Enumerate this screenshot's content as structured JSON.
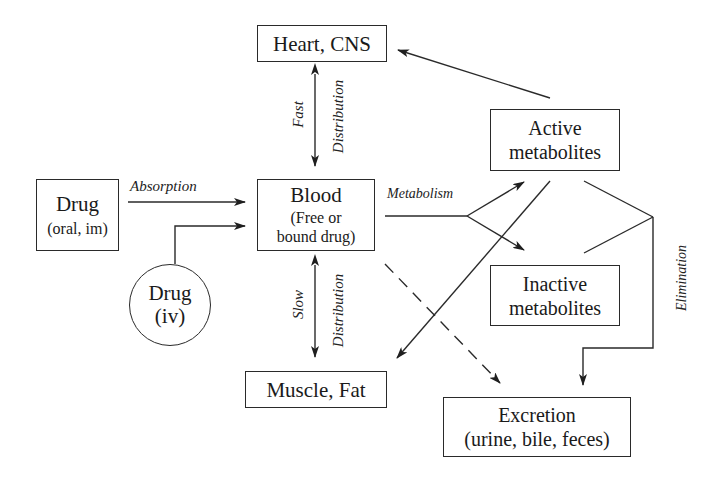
{
  "diagram": {
    "nodes": {
      "heart": {
        "label": "Heart, CNS"
      },
      "drug_oral": {
        "title": "Drug",
        "subtitle": "(oral, im)"
      },
      "blood": {
        "title": "Blood",
        "line2": "(Free or",
        "line3": "bound drug)"
      },
      "drug_iv": {
        "title": "Drug",
        "subtitle": "(iv)"
      },
      "muscle": {
        "label": "Muscle, Fat"
      },
      "active": {
        "line1": "Active",
        "line2": "metabolites"
      },
      "inactive": {
        "line1": "Inactive",
        "line2": "metabolites"
      },
      "excretion": {
        "line1": "Excretion",
        "line2": "(urine, bile, feces)"
      }
    },
    "edge_labels": {
      "absorption": "Absorption",
      "metabolism": "Metabolism",
      "fast": "Fast",
      "fast_distribution": "Distribution",
      "slow": "Slow",
      "slow_distribution": "Distribution",
      "elimination": "Elimination"
    },
    "edges": [
      {
        "from": "drug_oral",
        "to": "blood",
        "label": "Absorption"
      },
      {
        "from": "drug_iv",
        "to": "blood"
      },
      {
        "from": "blood",
        "to": "heart",
        "bidirectional": true,
        "label": "Fast Distribution"
      },
      {
        "from": "blood",
        "to": "muscle",
        "bidirectional": true,
        "label": "Slow Distribution"
      },
      {
        "from": "blood",
        "to": "active",
        "label": "Metabolism"
      },
      {
        "from": "blood",
        "to": "inactive",
        "label": "Metabolism"
      },
      {
        "from": "active",
        "to": "heart"
      },
      {
        "from": "active",
        "to": "muscle"
      },
      {
        "from": "blood",
        "to": "excretion",
        "style": "dashed"
      },
      {
        "from": "active",
        "to": "excretion",
        "label": "Elimination"
      },
      {
        "from": "inactive",
        "to": "excretion",
        "label": "Elimination"
      }
    ],
    "colors": {
      "stroke": "#2a2a2a",
      "background": "#ffffff"
    }
  }
}
